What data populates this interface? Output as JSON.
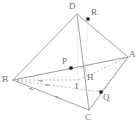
{
  "figure": {
    "type": "geometry-diagram",
    "canvas": {
      "width": 139,
      "height": 136
    },
    "stroke_color": "#8c8c8c",
    "dashed_color": "#a3a3a3",
    "dotted_color": "#b9b9b9",
    "point_color": "#1d1d1d",
    "label_color": "#6d6d6d",
    "background": "#ffffff",
    "vertices": [
      {
        "id": "D",
        "label": "D",
        "x": 77,
        "y": 14,
        "label_x": 69,
        "label_y": 2
      },
      {
        "id": "A",
        "label": "A",
        "x": 128,
        "y": 57,
        "label_x": 129,
        "label_y": 50
      },
      {
        "id": "B",
        "label": "B",
        "x": 13,
        "y": 80,
        "label_x": 2,
        "label_y": 75
      },
      {
        "id": "C",
        "label": "C",
        "x": 89,
        "y": 110,
        "label_x": 85,
        "label_y": 113
      }
    ],
    "points": [
      {
        "id": "R",
        "label": "R",
        "x": 88,
        "y": 19,
        "label_x": 91,
        "label_y": 8,
        "dot": true
      },
      {
        "id": "P",
        "label": "P",
        "x": 71,
        "y": 68,
        "label_x": 62,
        "label_y": 57,
        "dot": true
      },
      {
        "id": "H",
        "label": "H",
        "x": 85,
        "y": 74,
        "label_x": 87,
        "label_y": 73,
        "dot": false
      },
      {
        "id": "I",
        "label": "I",
        "x": 78,
        "y": 80,
        "label_x": 75,
        "label_y": 82,
        "dot": false
      },
      {
        "id": "Q",
        "label": "Q",
        "x": 101,
        "y": 92,
        "label_x": 103,
        "label_y": 93,
        "dot": true
      }
    ],
    "solid_edges": [
      {
        "from": "D",
        "to": "B",
        "name": "edge-DB"
      },
      {
        "from": "D",
        "to": "A",
        "name": "edge-DA"
      },
      {
        "from": "D",
        "to": "C",
        "name": "edge-DC"
      },
      {
        "from": "B",
        "to": "C",
        "name": "edge-BC"
      },
      {
        "from": "A",
        "to": "C",
        "name": "edge-AC"
      },
      {
        "from": "B",
        "to": "A",
        "name": "edge-BA"
      }
    ],
    "dashed_segments": [
      {
        "name": "segment-BPA",
        "x1": 13,
        "y1": 80,
        "x2": 128,
        "y2": 57
      },
      {
        "name": "segment-BQ",
        "x1": 13,
        "y1": 80,
        "x2": 101,
        "y2": 92
      },
      {
        "name": "segment-AQ",
        "x1": 128,
        "y1": 57,
        "x2": 101,
        "y2": 92
      },
      {
        "name": "segment-AI",
        "x1": 128,
        "y1": 57,
        "x2": 78,
        "y2": 80
      },
      {
        "name": "segment-BI",
        "x1": 13,
        "y1": 80,
        "x2": 78,
        "y2": 80
      }
    ],
    "dotted_segments": [
      {
        "name": "segment-D-I-vertical",
        "x1": 77,
        "y1": 14,
        "x2": 78,
        "y2": 88
      },
      {
        "name": "segment-R-H-vertical",
        "x1": 88,
        "y1": 19,
        "x2": 85,
        "y2": 90
      }
    ],
    "right_angle_marker": {
      "name": "right-angle-at-H",
      "x": 80,
      "y": 68,
      "size": 5
    },
    "tick_marks": [
      {
        "name": "tick-BC-1",
        "x": 31,
        "y": 89,
        "angle": 24
      },
      {
        "name": "tick-BC-2",
        "x": 57,
        "y": 97,
        "angle": 24
      },
      {
        "name": "tick-BI-1",
        "x": 41,
        "y": 81,
        "angle": 5
      },
      {
        "name": "tick-BQ-1",
        "x": 47,
        "y": 85,
        "angle": 8
      }
    ]
  }
}
